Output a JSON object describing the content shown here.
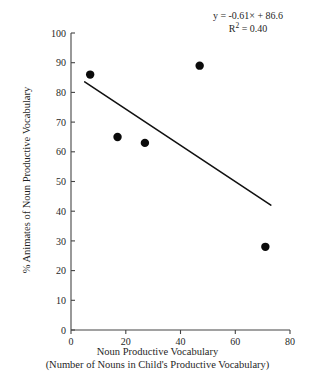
{
  "chart_data": {
    "type": "scatter",
    "title": "",
    "xlabel": "Noun Productive Vocabulary",
    "xlabel_line2": "(Number of Nouns in Child's Productive Vocabulary)",
    "ylabel": "% Animates of Noun Productive Vocabulary",
    "xlim": [
      0,
      80
    ],
    "ylim": [
      0,
      100
    ],
    "xticks": [
      0,
      20,
      40,
      60,
      80
    ],
    "yticks": [
      0,
      10,
      20,
      30,
      40,
      50,
      60,
      70,
      80,
      90,
      100
    ],
    "xtick_labels": [
      "0",
      "20",
      "40",
      "60",
      "80"
    ],
    "ytick_labels": [
      "0",
      "10",
      "20",
      "30",
      "40",
      "50",
      "60",
      "70",
      "80",
      "90",
      "100"
    ],
    "grid": false,
    "legend": false,
    "points": [
      {
        "x": 7,
        "y": 86
      },
      {
        "x": 17,
        "y": 65
      },
      {
        "x": 27,
        "y": 63
      },
      {
        "x": 47,
        "y": 89
      },
      {
        "x": 71,
        "y": 28
      }
    ],
    "trendline": {
      "slope": -0.61,
      "intercept": 86.6,
      "x_start": 5,
      "x_end": 73
    },
    "annotations": {
      "equation_prefix": "y = -0.61",
      "equation_x": "×",
      "equation_suffix": " + 86.6",
      "equation_full": "y = -0.61× + 86.6",
      "r_squared_prefix": "R",
      "r_squared_exponent": "2",
      "r_squared_value": " = 0.40",
      "r_squared_full": "R2 = 0.40"
    }
  }
}
